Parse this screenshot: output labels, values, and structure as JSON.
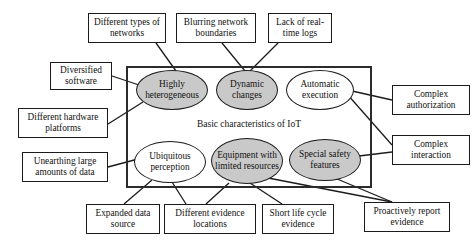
{
  "diagram": {
    "title": "Basic characteristics of IoT",
    "container_label": "Basic characteristics of IoT",
    "colors": {
      "gray_fill": "#c9c9c9",
      "white_fill": "#ffffff",
      "stroke": "#1b1b1b",
      "container_stroke": "#2b2b2b",
      "background": "#ffffff"
    },
    "center_nodes": [
      {
        "id": "highly-heterogeneous",
        "label": "Highly heterogeneous",
        "fill": "gray",
        "x": 136,
        "y": 70,
        "w": 72,
        "h": 40
      },
      {
        "id": "dynamic-changes",
        "label": "Dynamic changes",
        "fill": "gray",
        "x": 216,
        "y": 70,
        "w": 62,
        "h": 40
      },
      {
        "id": "automatic-execution",
        "label": "Automatic execution",
        "fill": "white",
        "x": 286,
        "y": 70,
        "w": 68,
        "h": 40
      },
      {
        "id": "ubiquitous-perception",
        "label": "Ubiquitous perception",
        "fill": "white",
        "x": 134,
        "y": 141,
        "w": 72,
        "h": 42
      },
      {
        "id": "equipment-limited-resources",
        "label": "Equipment with limited resources",
        "fill": "gray",
        "x": 211,
        "y": 138,
        "w": 72,
        "h": 46
      },
      {
        "id": "special-safety-features",
        "label": "Special safety features",
        "fill": "gray",
        "x": 289,
        "y": 139,
        "w": 72,
        "h": 42
      }
    ],
    "leaf_nodes": [
      {
        "id": "different-types-of-networks",
        "label": "Different types of networks",
        "x": 88,
        "y": 13,
        "w": 78,
        "h": 30
      },
      {
        "id": "blurring-network-boundaries",
        "label": "Blurring network boundaries",
        "x": 176,
        "y": 13,
        "w": 80,
        "h": 30
      },
      {
        "id": "lack-of-real-time-logs",
        "label": "Lack of real-time logs",
        "x": 268,
        "y": 13,
        "w": 64,
        "h": 30
      },
      {
        "id": "diversified-software",
        "label": "Diversified software",
        "x": 50,
        "y": 62,
        "w": 62,
        "h": 28
      },
      {
        "id": "different-hardware-platforms",
        "label": "Different hardware platforms",
        "x": 18,
        "y": 108,
        "w": 90,
        "h": 30
      },
      {
        "id": "unearthing-large-amounts-of-data",
        "label": "Unearthing large amounts of data",
        "x": 22,
        "y": 152,
        "w": 86,
        "h": 30
      },
      {
        "id": "complex-authorization",
        "label": "Complex authorization",
        "x": 392,
        "y": 85,
        "w": 78,
        "h": 30
      },
      {
        "id": "complex-interaction",
        "label": "Complex interaction",
        "x": 392,
        "y": 135,
        "w": 78,
        "h": 30
      },
      {
        "id": "expanded-data-source",
        "label": "Expanded data source",
        "x": 86,
        "y": 204,
        "w": 74,
        "h": 30
      },
      {
        "id": "different-evidence-locations",
        "label": "Different evidence locations",
        "x": 164,
        "y": 204,
        "w": 92,
        "h": 30
      },
      {
        "id": "short-life-cycle-evidence",
        "label": "Short life cycle evidence",
        "x": 262,
        "y": 204,
        "w": 72,
        "h": 30
      },
      {
        "id": "proactively-report-evidence",
        "label": "Proactively report evidence",
        "x": 364,
        "y": 202,
        "w": 86,
        "h": 30
      }
    ],
    "container": {
      "x": 126,
      "y": 66,
      "w": 246,
      "h": 122
    },
    "edges": [
      {
        "from": "different-types-of-networks",
        "to": "highly-heterogeneous",
        "x1": 156,
        "y1": 43,
        "x2": 176,
        "y2": 71
      },
      {
        "from": "blurring-network-boundaries",
        "to": "dynamic-changes",
        "x1": 222,
        "y1": 43,
        "x2": 245,
        "y2": 71
      },
      {
        "from": "lack-of-real-time-logs",
        "to": "dynamic-changes",
        "x1": 278,
        "y1": 43,
        "x2": 250,
        "y2": 71
      },
      {
        "from": "diversified-software",
        "to": "highly-heterogeneous",
        "x1": 112,
        "y1": 76,
        "x2": 139,
        "y2": 85
      },
      {
        "from": "different-hardware-platforms",
        "to": "highly-heterogeneous",
        "x1": 108,
        "y1": 124,
        "x2": 143,
        "y2": 102
      },
      {
        "from": "unearthing-large-amounts-of-data",
        "to": "ubiquitous-perception",
        "x1": 108,
        "y1": 167,
        "x2": 138,
        "y2": 159
      },
      {
        "from": "automatic-execution",
        "to": "complex-authorization",
        "x1": 352,
        "y1": 91,
        "x2": 392,
        "y2": 100
      },
      {
        "from": "automatic-execution",
        "to": "complex-interaction",
        "x1": 347,
        "y1": 94,
        "x2": 392,
        "y2": 145
      },
      {
        "from": "special-safety-features",
        "to": "complex-interaction",
        "x1": 359,
        "y1": 156,
        "x2": 392,
        "y2": 152
      },
      {
        "from": "ubiquitous-perception",
        "to": "expanded-data-source",
        "x1": 152,
        "y1": 180,
        "x2": 124,
        "y2": 204
      },
      {
        "from": "ubiquitous-perception",
        "to": "different-evidence-locations",
        "x1": 172,
        "y1": 182,
        "x2": 186,
        "y2": 204
      },
      {
        "from": "equipment-limited-resources",
        "to": "different-evidence-locations",
        "x1": 229,
        "y1": 183,
        "x2": 206,
        "y2": 204
      },
      {
        "from": "equipment-limited-resources",
        "to": "short-life-cycle-evidence",
        "x1": 250,
        "y1": 183,
        "x2": 282,
        "y2": 204
      },
      {
        "from": "equipment-limited-resources",
        "to": "proactively-report-evidence",
        "x1": 263,
        "y1": 177,
        "x2": 392,
        "y2": 202
      },
      {
        "from": "special-safety-features",
        "to": "proactively-report-evidence",
        "x1": 330,
        "y1": 176,
        "x2": 392,
        "y2": 202
      }
    ]
  }
}
